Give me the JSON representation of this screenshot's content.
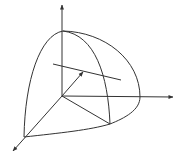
{
  "diagram": {
    "type": "3d-coordinate-octant-sketch",
    "stroke_color": "#333333",
    "background": "#ffffff",
    "elements": [
      "z-axis (vertical, arrow up)",
      "x-axis (horizontal, arrow right)",
      "y-axis (diagonal, arrow lower-left)",
      "octant surface patch with meridian curve",
      "line segment crossing surface",
      "vector arrow from origin"
    ]
  }
}
